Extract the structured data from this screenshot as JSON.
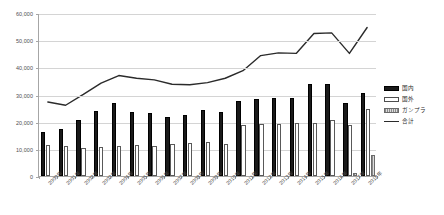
{
  "chart_data": {
    "type": "bar",
    "title": "",
    "xlabel": "",
    "ylabel": "",
    "ylim": [
      0,
      60000
    ],
    "ytick_labels": [
      "0",
      "10,000",
      "20,000",
      "30,000",
      "40,000",
      "50,000",
      "60,000"
    ],
    "ytick_values": [
      0,
      10000,
      20000,
      30000,
      40000,
      50000,
      60000
    ],
    "grid": true,
    "legend_position": "right",
    "categories": [
      "2000年",
      "2001年",
      "2002年",
      "2003年",
      "2004年",
      "2005年",
      "2006年",
      "2007年",
      "2008年",
      "2009年",
      "2010年",
      "2011年",
      "2012年",
      "2013年",
      "2014年",
      "2015年",
      "2016年",
      "2017年",
      "2018年"
    ],
    "series": [
      {
        "name": "国内",
        "type": "bar",
        "color": "#1a1a1a",
        "values": [
          16200,
          17400,
          20800,
          24000,
          27000,
          23600,
          23200,
          21800,
          22400,
          24200,
          23400,
          27500,
          28500,
          28600,
          28800,
          34000,
          34000,
          27000,
          30500
        ]
      },
      {
        "name": "国外",
        "type": "bar",
        "color": "#ffffff",
        "values": [
          11600,
          11200,
          10400,
          10800,
          11000,
          11600,
          11000,
          11800,
          12200,
          12600,
          11800,
          18700,
          19000,
          19200,
          19400,
          19500,
          20500,
          18600,
          24500
        ]
      },
      {
        "name": "ガンプラ",
        "type": "bar",
        "color": "#9a9a9a",
        "values": [
          0,
          0,
          0,
          0,
          0,
          0,
          0,
          0,
          0,
          0,
          0,
          0,
          0,
          0,
          0,
          0,
          0,
          1200,
          7800
        ]
      },
      {
        "name": "合計",
        "type": "line",
        "color": "#2b2b2b",
        "values": [
          27400,
          26200,
          30200,
          34400,
          37200,
          36200,
          35600,
          34000,
          33800,
          34600,
          36200,
          39000,
          44600,
          45600,
          45400,
          52800,
          53000,
          45400,
          55000
        ]
      }
    ]
  },
  "legend": {
    "items": [
      {
        "label": "国内",
        "key": "domestic"
      },
      {
        "label": "国外",
        "key": "overseas"
      },
      {
        "label": "ガンプラ",
        "key": "gunpla"
      },
      {
        "label": "合計",
        "key": "total"
      }
    ]
  },
  "caption": {
    "top_remnant": ""
  }
}
